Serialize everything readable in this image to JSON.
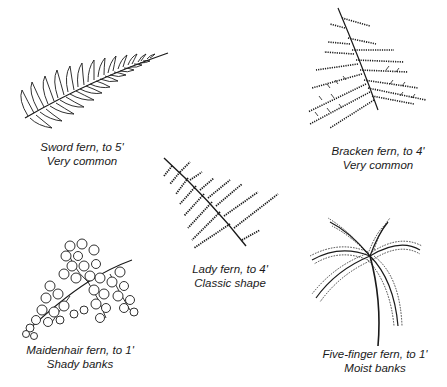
{
  "figure": {
    "ferns": [
      {
        "id": "sword",
        "name_line": "Sword fern, to 5'",
        "habitat_line": "Very common",
        "icon": "sword-fern-illustration"
      },
      {
        "id": "bracken",
        "name_line": "Bracken fern, to 4'",
        "habitat_line": "Very common",
        "icon": "bracken-fern-illustration"
      },
      {
        "id": "lady",
        "name_line": "Lady fern, to 4'",
        "habitat_line": "Classic shape",
        "icon": "lady-fern-illustration"
      },
      {
        "id": "maidenhair",
        "name_line": "Maidenhair fern, to 1'",
        "habitat_line": "Shady banks",
        "icon": "maidenhair-fern-illustration"
      },
      {
        "id": "fivefinger",
        "name_line": "Five-finger fern, to 1'",
        "habitat_line": "Moist banks",
        "icon": "five-finger-fern-illustration"
      }
    ],
    "colors": {
      "ink": "#1a1a1a",
      "background": "#ffffff"
    }
  }
}
